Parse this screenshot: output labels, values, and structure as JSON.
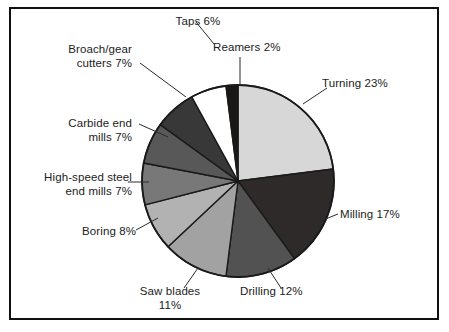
{
  "figure": {
    "background_color": "#ffffff",
    "frame_color": "#111111",
    "outline_color": "#1a1a1a",
    "label_color": "#1c1c1c"
  },
  "chart_data": {
    "type": "pie",
    "title": "",
    "subtitle": "",
    "xlabel": "",
    "ylabel": "",
    "units": "percent",
    "total_percent": 100,
    "start_angle_deg": 0,
    "direction": "clockwise",
    "legend_position": "none",
    "labels_position": "outside-with-leader-lines",
    "grid": false,
    "categories": [
      "Turning",
      "Milling",
      "Drilling",
      "Saw blades",
      "Boring",
      "High-speed steel end mills",
      "Carbide end mills",
      "Broach/gear cutters",
      "Taps",
      "Reamers"
    ],
    "values": [
      23,
      17,
      12,
      11,
      8,
      7,
      7,
      7,
      6,
      2
    ],
    "colors": [
      "#d7d7d7",
      "#2e2a2a",
      "#525252",
      "#a2a2a2",
      "#b2b2b2",
      "#787878",
      "#585858",
      "#383838",
      "#ffffff",
      "#1a1717"
    ],
    "slices": [
      {
        "name": "Turning",
        "value": 23,
        "label": "Turning 23%",
        "color": "#d7d7d7"
      },
      {
        "name": "Milling",
        "value": 17,
        "label": "Milling 17%",
        "color": "#2e2a2a"
      },
      {
        "name": "Drilling",
        "value": 12,
        "label": "Drilling 12%",
        "color": "#525252"
      },
      {
        "name": "Saw blades",
        "value": 11,
        "label": "Saw blades\n11%",
        "color": "#a2a2a2"
      },
      {
        "name": "Boring",
        "value": 8,
        "label": "Boring 8%",
        "color": "#b2b2b2"
      },
      {
        "name": "High-speed steel end mills",
        "value": 7,
        "label": "High-speed steel\nend mills 7%",
        "color": "#787878"
      },
      {
        "name": "Carbide end mills",
        "value": 7,
        "label": "Carbide end\nmills 7%",
        "color": "#585858"
      },
      {
        "name": "Broach/gear cutters",
        "value": 7,
        "label": "Broach/gear\ncutters 7%",
        "color": "#383838"
      },
      {
        "name": "Taps",
        "value": 6,
        "label": "Taps 6%",
        "color": "#ffffff"
      },
      {
        "name": "Reamers",
        "value": 2,
        "label": "Reamers 2%",
        "color": "#1a1717"
      }
    ]
  },
  "labels": {
    "turning": "Turning 23%",
    "milling": "Milling 17%",
    "drilling": "Drilling 12%",
    "saw_blades": "Saw blades\n11%",
    "boring": "Boring 8%",
    "hss_end_mills": "High-speed steel\nend mills 7%",
    "carbide_end_mills": "Carbide end\nmills 7%",
    "broach_gear_cutters": "Broach/gear\ncutters 7%",
    "taps": "Taps 6%",
    "reamers": "Reamers 2%"
  }
}
